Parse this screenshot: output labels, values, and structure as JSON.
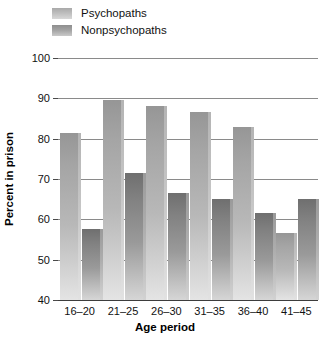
{
  "chart_data": {
    "type": "bar",
    "title": "",
    "xlabel": "Age period",
    "ylabel": "Percent in prison",
    "categories": [
      "16–20",
      "21–25",
      "26–30",
      "31–35",
      "36–40",
      "41–45"
    ],
    "series": [
      {
        "name": "Psychopaths",
        "values": [
          81.5,
          89.5,
          88.0,
          86.5,
          83.0,
          56.5
        ],
        "color": "#b8b8b8"
      },
      {
        "name": "Nonpsychopaths",
        "values": [
          57.5,
          71.5,
          66.5,
          65.0,
          61.5,
          65.0
        ],
        "color": "#9a9a9a"
      }
    ],
    "ylim": [
      40,
      100
    ],
    "yticks": [
      40,
      50,
      60,
      70,
      80,
      90,
      100
    ],
    "ytick_labels": [
      "40",
      "50",
      "60",
      "70",
      "80",
      "90",
      "100"
    ],
    "grid": "horizontal",
    "legend_position": "top-left"
  },
  "legend": {
    "items": [
      {
        "label": "Psychopaths"
      },
      {
        "label": "Nonpsychopaths"
      }
    ]
  }
}
